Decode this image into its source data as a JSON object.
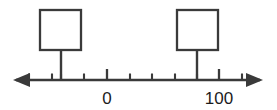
{
  "figure": {
    "colors": {
      "ink": "#3a3a3a",
      "label": "#1c1c1c",
      "background": "#ffffff",
      "box_fill": "#ffffff"
    }
  },
  "chart_data": {
    "type": "line",
    "title": "",
    "xlabel": "",
    "ylabel": "",
    "grid": false,
    "legend": null,
    "orientation": "horizontal",
    "axis": {
      "name": "number-line",
      "x_start_px": 14,
      "x_end_px": 262,
      "y_px": 80,
      "left_arrow": true,
      "right_arrow": true
    },
    "tick_labels": [
      "",
      "",
      "",
      "",
      "0",
      "",
      "",
      "",
      "",
      "100",
      ""
    ],
    "ticks": [
      {
        "index": 0,
        "x_px": 29,
        "value": null,
        "label": "",
        "major": false
      },
      {
        "index": 1,
        "x_px": 52,
        "value": null,
        "label": "",
        "major": false
      },
      {
        "index": 2,
        "x_px": 61,
        "value": null,
        "label": "",
        "major": false
      },
      {
        "index": 3,
        "x_px": 84,
        "value": null,
        "label": "",
        "major": false
      },
      {
        "index": 4,
        "x_px": 107,
        "value": 0,
        "label": "0",
        "major": true
      },
      {
        "index": 5,
        "x_px": 130,
        "value": null,
        "label": "",
        "major": false
      },
      {
        "index": 6,
        "x_px": 152,
        "value": null,
        "label": "",
        "major": false
      },
      {
        "index": 7,
        "x_px": 175,
        "value": null,
        "label": "",
        "major": false
      },
      {
        "index": 8,
        "x_px": 197,
        "value": null,
        "label": "",
        "major": false
      },
      {
        "index": 9,
        "x_px": 219,
        "value": 100,
        "label": "100",
        "major": true
      },
      {
        "index": 10,
        "x_px": 242,
        "value": null,
        "label": "",
        "major": false
      }
    ],
    "labels": [
      {
        "name": "tick-label-zero",
        "text": "0",
        "x_px": 107,
        "y_px": 104
      },
      {
        "name": "tick-label-hundred",
        "text": "100",
        "x_px": 219,
        "y_px": 104
      }
    ],
    "markers": [
      {
        "name": "answer-box-left",
        "text": "",
        "tick_index": 2,
        "x_px": 61,
        "box_x_px": 40,
        "box_y_px": 10,
        "box_w_px": 41,
        "box_h_px": 40,
        "stem_top_px": 50,
        "stem_bottom_px": 80
      },
      {
        "name": "answer-box-right",
        "text": "",
        "tick_index": 8,
        "x_px": 197,
        "box_x_px": 177,
        "box_y_px": 10,
        "box_w_px": 41,
        "box_h_px": 40,
        "stem_top_px": 50,
        "stem_bottom_px": 80
      }
    ]
  }
}
